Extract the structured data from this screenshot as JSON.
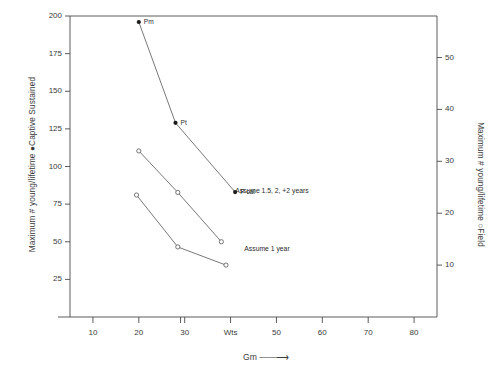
{
  "chart_data": {
    "type": "line",
    "title": "",
    "xlabel": "Gm",
    "ylabel": "Maximum # young/lifetime  ●Captive Sustained",
    "ylabel_right": "Maximum # young/lifetime  ○Field",
    "xlim": [
      5,
      85
    ],
    "ylim": [
      0,
      200
    ],
    "ylim_right": [
      0,
      58
    ],
    "grid": false,
    "legend": "none",
    "xticks": [
      10,
      20,
      30,
      40,
      50,
      60,
      70,
      80
    ],
    "xtick_labels": [
      "10",
      "20",
      "30",
      "Wts",
      "50",
      "60",
      "70",
      "80"
    ],
    "yticks_left": [
      25,
      50,
      75,
      100,
      125,
      150,
      175,
      200
    ],
    "ytick_labels_left": [
      "25",
      "50",
      "75",
      "100",
      "125",
      "150",
      "175",
      "200"
    ],
    "yticks_right": [
      10,
      20,
      30,
      40,
      50
    ],
    "ytick_labels_right": [
      "10",
      "20",
      "30",
      "40",
      "50"
    ],
    "series": [
      {
        "name": "Captive Sustained",
        "marker": "filled-circle",
        "axis": "left",
        "x": [
          20,
          28,
          41
        ],
        "y": [
          196,
          129,
          83
        ],
        "point_labels": [
          "Pm",
          "Pt",
          "P cal"
        ]
      },
      {
        "name": "Assume 1.5, 2, +2 years",
        "marker": "open-circle",
        "axis": "right",
        "x": [
          20,
          28.5,
          38
        ],
        "y": [
          32,
          24,
          14.5
        ],
        "point_labels": [
          "",
          "",
          ""
        ]
      },
      {
        "name": "Assume 1 year",
        "marker": "open-circle",
        "axis": "right",
        "x": [
          19.5,
          28.5,
          39
        ],
        "y": [
          23.5,
          13.5,
          10
        ],
        "point_labels": [
          "",
          "",
          ""
        ]
      }
    ],
    "annotations": [
      {
        "text": "Assume 1.5, 2, +2 years",
        "x": 41,
        "y": 24
      },
      {
        "text": "Assume 1 year",
        "x": 43,
        "y": 13
      }
    ],
    "arrow_after_xlabel": true
  }
}
